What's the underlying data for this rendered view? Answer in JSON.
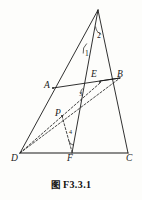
{
  "figure": {
    "caption_cjk": "图",
    "caption_id": "F3.3.1",
    "caption_full": "图 F3.3.1",
    "type": "geometry-diagram",
    "stroke_color": "#1a1a1a",
    "background_color": "#fdfdfb"
  },
  "points": {
    "apex": {
      "label": "",
      "x": 98,
      "y": 10
    },
    "A": {
      "label": "A",
      "x": 53,
      "y": 88
    },
    "B": {
      "label": "B",
      "x": 120,
      "y": 78
    },
    "C": {
      "label": "C",
      "x": 128,
      "y": 153
    },
    "D": {
      "label": "D",
      "x": 20,
      "y": 153
    },
    "E": {
      "label": "E",
      "x": 100,
      "y": 82
    },
    "F": {
      "label": "F",
      "x": 72,
      "y": 153
    },
    "P": {
      "label": "P",
      "x": 62,
      "y": 116
    }
  },
  "vertex_labels": [
    {
      "name": "A",
      "text": "A",
      "x": 44,
      "y": 81
    },
    {
      "name": "B",
      "text": "B",
      "x": 117,
      "y": 70
    },
    {
      "name": "C",
      "text": "C",
      "x": 126,
      "y": 154
    },
    {
      "name": "D",
      "text": "D",
      "x": 11,
      "y": 154
    },
    {
      "name": "E",
      "text": "E",
      "x": 91,
      "y": 70
    },
    {
      "name": "F",
      "text": "F",
      "x": 67,
      "y": 154
    },
    {
      "name": "P",
      "text": "P",
      "x": 55,
      "y": 109
    }
  ],
  "angle_labels": [
    {
      "name": "angle-1",
      "text": "1",
      "x": 85,
      "y": 50
    },
    {
      "name": "angle-2",
      "text": "2",
      "x": 97,
      "y": 32
    },
    {
      "name": "angle-3",
      "text": "3",
      "x": 79,
      "y": 91
    },
    {
      "name": "angle-4",
      "text": "4",
      "x": 69,
      "y": 129
    }
  ],
  "segments": [
    {
      "name": "apex-to-D",
      "style": "solid",
      "from": "apex",
      "to": "D"
    },
    {
      "name": "apex-to-C",
      "style": "solid",
      "from": "apex",
      "to": "C"
    },
    {
      "name": "apex-to-F",
      "style": "solid",
      "from": "apex",
      "to": "F"
    },
    {
      "name": "D-to-C",
      "style": "solid",
      "from": "D",
      "to": "C"
    },
    {
      "name": "A-to-B",
      "style": "solid",
      "from": "A",
      "to": "B"
    },
    {
      "name": "D-to-B",
      "style": "dashed",
      "from": "D",
      "to": "B"
    },
    {
      "name": "D-to-E",
      "style": "dashed",
      "from": "D",
      "to": "E"
    },
    {
      "name": "P-to-F",
      "style": "dashed",
      "from": "P",
      "to": "F"
    }
  ]
}
